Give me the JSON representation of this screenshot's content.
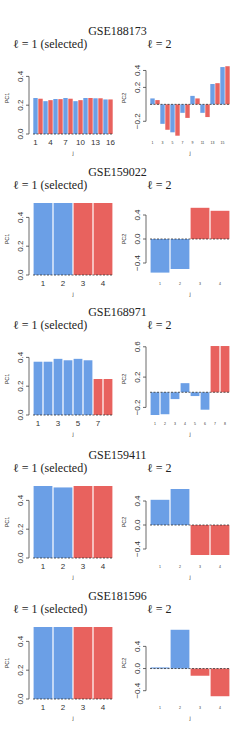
{
  "colors": {
    "blue": "#6b9fe6",
    "red": "#e8625e",
    "axis": "#444444"
  },
  "panels": [
    {
      "title": "GSE188173",
      "left_label": "ℓ = 1 (selected)",
      "right_label": "ℓ = 2"
    },
    {
      "title": "GSE159022",
      "left_label": "ℓ = 1 (selected)",
      "right_label": "ℓ = 2"
    },
    {
      "title": "GSE168971",
      "left_label": "ℓ = 1 (selected)",
      "right_label": "ℓ = 2"
    },
    {
      "title": "GSE159411",
      "left_label": "ℓ = 1 (selected)",
      "right_label": "ℓ = 2"
    },
    {
      "title": "GSE181596",
      "left_label": "ℓ = 1 (selected)",
      "right_label": "ℓ = 2"
    }
  ],
  "chart_data": [
    {
      "type": "bar",
      "title": "GSE188173 ℓ = 1 (selected)",
      "xlabel": "j",
      "ylabel": "PC1",
      "ylim": [
        0,
        0.5
      ],
      "yticks": [
        0.0,
        0.2,
        0.4
      ],
      "xticks": [
        "1",
        "4",
        "7",
        "10",
        "13",
        "16"
      ],
      "categories": [
        "1",
        "2",
        "3",
        "4",
        "5",
        "6",
        "7",
        "8",
        "9",
        "10",
        "11",
        "12",
        "13",
        "14",
        "15",
        "16"
      ],
      "values": [
        0.25,
        0.245,
        0.228,
        0.235,
        0.243,
        0.242,
        0.25,
        0.245,
        0.228,
        0.235,
        0.25,
        0.25,
        0.248,
        0.248,
        0.24,
        0.24
      ],
      "colors": [
        "blue",
        "red",
        "blue",
        "red",
        "blue",
        "red",
        "blue",
        "red",
        "blue",
        "red",
        "blue",
        "red",
        "blue",
        "red",
        "blue",
        "red"
      ]
    },
    {
      "type": "bar",
      "title": "GSE188173 ℓ = 2",
      "xlabel": "j",
      "ylabel": "PC2",
      "ylim": [
        -0.35,
        0.5
      ],
      "yticks": [
        -0.2,
        0.2,
        0.4
      ],
      "xticks": [
        "1",
        "3",
        "5",
        "7",
        "9",
        "11",
        "13",
        "15"
      ],
      "categories": [
        "1",
        "2",
        "3",
        "4",
        "5",
        "6",
        "7",
        "8",
        "9",
        "10",
        "11",
        "12",
        "13",
        "14",
        "15",
        "16"
      ],
      "values": [
        0.07,
        0.05,
        -0.23,
        -0.3,
        -0.33,
        -0.37,
        -0.1,
        -0.16,
        0.1,
        0.07,
        -0.1,
        -0.15,
        0.24,
        0.25,
        0.44,
        0.45
      ],
      "colors": [
        "blue",
        "red",
        "blue",
        "red",
        "blue",
        "red",
        "blue",
        "red",
        "blue",
        "red",
        "blue",
        "red",
        "blue",
        "red",
        "blue",
        "red"
      ]
    },
    {
      "type": "bar",
      "title": "GSE159022 ℓ = 1 (selected)",
      "xlabel": "j",
      "ylabel": "PC1",
      "ylim": [
        0,
        0.5
      ],
      "yticks": [
        0.0,
        0.2,
        0.4
      ],
      "xticks": [
        "1",
        "2",
        "3",
        "4"
      ],
      "categories": [
        "1",
        "2",
        "3",
        "4"
      ],
      "values": [
        0.5,
        0.5,
        0.5,
        0.5
      ],
      "colors": [
        "blue",
        "blue",
        "red",
        "red"
      ]
    },
    {
      "type": "bar",
      "title": "GSE159022 ℓ = 2",
      "xlabel": "j",
      "ylabel": "PC2",
      "ylim": [
        -0.6,
        0.6
      ],
      "yticks": [
        -0.4,
        0.0,
        0.4
      ],
      "xticks": [
        "1",
        "2",
        "3",
        "4"
      ],
      "categories": [
        "1",
        "2",
        "3",
        "4"
      ],
      "values": [
        -0.56,
        -0.5,
        0.52,
        0.47
      ],
      "colors": [
        "blue",
        "blue",
        "red",
        "red"
      ]
    },
    {
      "type": "bar",
      "title": "GSE168971 ℓ = 1 (selected)",
      "xlabel": "j",
      "ylabel": "PC1",
      "ylim": [
        0,
        0.5
      ],
      "yticks": [
        0.0,
        0.2,
        0.4
      ],
      "xticks": [
        "1",
        "3",
        "5",
        "7"
      ],
      "categories": [
        "1",
        "2",
        "3",
        "4",
        "5",
        "6",
        "7",
        "8"
      ],
      "values": [
        0.37,
        0.37,
        0.39,
        0.38,
        0.39,
        0.38,
        0.25,
        0.25
      ],
      "colors": [
        "blue",
        "blue",
        "blue",
        "blue",
        "blue",
        "blue",
        "red",
        "red"
      ]
    },
    {
      "type": "bar",
      "title": "GSE168971 ℓ = 2",
      "xlabel": "j",
      "ylabel": "PC2",
      "ylim": [
        -0.3,
        0.65
      ],
      "yticks": [
        -0.2,
        0.2,
        0.6
      ],
      "xticks": [
        "1",
        "2",
        "3",
        "4",
        "5",
        "6",
        "7",
        "8"
      ],
      "categories": [
        "1",
        "2",
        "3",
        "4",
        "5",
        "6",
        "7",
        "8"
      ],
      "values": [
        -0.3,
        -0.29,
        -0.09,
        0.12,
        -0.05,
        -0.23,
        0.61,
        0.61
      ],
      "colors": [
        "blue",
        "blue",
        "blue",
        "blue",
        "blue",
        "blue",
        "red",
        "red"
      ]
    },
    {
      "type": "bar",
      "title": "GSE159411 ℓ = 1 (selected)",
      "xlabel": "j",
      "ylabel": "PC1",
      "ylim": [
        0,
        0.5
      ],
      "yticks": [
        0.0,
        0.2,
        0.4
      ],
      "xticks": [
        "1",
        "2",
        "3",
        "4"
      ],
      "categories": [
        "1",
        "2",
        "3",
        "4"
      ],
      "values": [
        0.5,
        0.49,
        0.5,
        0.5
      ],
      "colors": [
        "blue",
        "blue",
        "red",
        "red"
      ]
    },
    {
      "type": "bar",
      "title": "GSE159411 ℓ = 2",
      "xlabel": "j",
      "ylabel": "PC2",
      "ylim": [
        -0.55,
        0.65
      ],
      "yticks": [
        -0.4,
        0.0,
        0.4
      ],
      "xticks": [
        "1",
        "2",
        "3",
        "4"
      ],
      "categories": [
        "1",
        "2",
        "3",
        "4"
      ],
      "values": [
        0.42,
        0.6,
        -0.5,
        -0.5
      ],
      "colors": [
        "blue",
        "blue",
        "red",
        "red"
      ]
    },
    {
      "type": "bar",
      "title": "GSE181596 ℓ = 1 (selected)",
      "xlabel": "j",
      "ylabel": "PC1",
      "ylim": [
        0,
        0.5
      ],
      "yticks": [
        0.0,
        0.2,
        0.4
      ],
      "xticks": [
        "1",
        "2",
        "3",
        "4"
      ],
      "categories": [
        "1",
        "2",
        "3",
        "4"
      ],
      "values": [
        0.5,
        0.5,
        0.5,
        0.5
      ],
      "colors": [
        "blue",
        "blue",
        "red",
        "red"
      ]
    },
    {
      "type": "bar",
      "title": "GSE181596 ℓ = 2",
      "xlabel": "j",
      "ylabel": "PC2",
      "ylim": [
        -0.55,
        0.75
      ],
      "yticks": [
        -0.4,
        0.0,
        0.4
      ],
      "xticks": [
        "1",
        "2",
        "3",
        "4"
      ],
      "categories": [
        "1",
        "2",
        "3",
        "4"
      ],
      "values": [
        0.02,
        0.7,
        -0.13,
        -0.5
      ],
      "colors": [
        "blue",
        "blue",
        "red",
        "red"
      ]
    }
  ]
}
